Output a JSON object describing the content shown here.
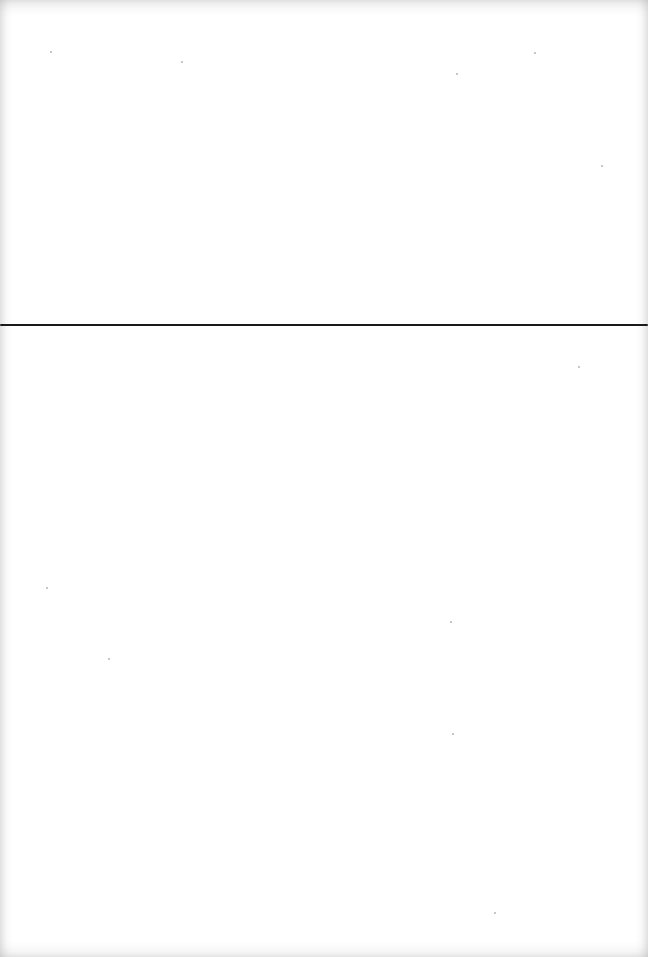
{
  "document": {
    "type": "scanned-blank-page",
    "background_color": "#ffffff",
    "rule": {
      "orientation": "horizontal",
      "color": "#1a1a1a",
      "y": 324,
      "thickness": 2
    },
    "text_content": ""
  }
}
